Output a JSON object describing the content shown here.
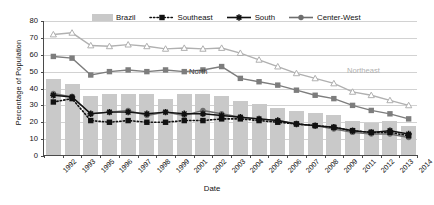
{
  "chart_data": {
    "type": "bar",
    "title": "",
    "xlabel": "Date",
    "ylabel": "Percentage of Population",
    "ylim": [
      0,
      80
    ],
    "ytick_step": 10,
    "yticks": [
      0,
      10,
      20,
      30,
      40,
      50,
      60,
      70,
      80
    ],
    "grid": true,
    "legend_position": "top",
    "categories": [
      "1992",
      "1993",
      "1995",
      "1996",
      "1997",
      "1998",
      "1999",
      "2001",
      "2002",
      "2003",
      "2004",
      "2005",
      "2006",
      "2007",
      "2008",
      "2009",
      "2011",
      "2012",
      "2013",
      "2014"
    ],
    "series": [
      {
        "name": "Brazil",
        "kind": "bar",
        "color": "#c9c9c9",
        "values": [
          45,
          42,
          35,
          36,
          36,
          36,
          33,
          36,
          36,
          35,
          32,
          30,
          28,
          26,
          25,
          24,
          20,
          19,
          20,
          17
        ]
      },
      {
        "name": "Northeast",
        "kind": "line",
        "marker": "open-triangle",
        "color": "#b0b0b0",
        "inline_label": "Northeast",
        "values": [
          72,
          73,
          65.5,
          65,
          66,
          65,
          63.5,
          64,
          63.5,
          64,
          61,
          57,
          53,
          49,
          46,
          43,
          38,
          36,
          33,
          30
        ]
      },
      {
        "name": "North",
        "kind": "line",
        "marker": "filled-square",
        "color": "#7d7d7d",
        "inline_label": "North",
        "values": [
          59,
          58,
          48,
          50,
          51,
          50,
          51,
          50,
          51,
          53,
          46,
          44,
          42,
          39,
          36,
          34,
          30,
          27,
          25,
          22
        ]
      },
      {
        "name": "Center-West",
        "kind": "line",
        "marker": "filled-circle",
        "color": "#6e6e6e",
        "values": [
          37,
          35,
          25,
          26,
          27,
          24,
          26,
          24,
          27,
          25,
          23,
          22,
          21,
          19,
          18,
          16,
          14,
          13,
          13,
          11
        ]
      },
      {
        "name": "South",
        "kind": "line",
        "marker": "star-burst",
        "color": "#111111",
        "values": [
          36,
          35,
          25,
          26,
          26,
          25,
          26,
          25,
          25,
          24,
          23,
          22,
          21,
          19,
          18,
          17,
          15,
          14,
          15,
          13
        ]
      },
      {
        "name": "Southeast",
        "kind": "line-dotted",
        "marker": "filled-square",
        "color": "#111111",
        "values": [
          32,
          34,
          21,
          20,
          21,
          20,
          20,
          21,
          21,
          22,
          22,
          21,
          20,
          19,
          18,
          17,
          15,
          14,
          14,
          12
        ]
      }
    ]
  },
  "axes": {
    "ylabel": "Percentage of Population",
    "xlabel": "Date",
    "ytick_labels": [
      "80",
      "70",
      "60",
      "50",
      "40",
      "30",
      "20",
      "10",
      "0"
    ],
    "xtick_labels": [
      "1992",
      "1993",
      "1995",
      "1996",
      "1997",
      "1998",
      "1999",
      "2001",
      "2002",
      "2003",
      "2004",
      "2005",
      "2006",
      "2007",
      "2008",
      "2009",
      "2011",
      "2012",
      "2013",
      "2014"
    ]
  },
  "legend": {
    "entries": [
      {
        "label": "Brazil",
        "icon": "filled-bar-swatch-icon"
      },
      {
        "label": "Southeast",
        "icon": "dotted-line-square-marker-icon"
      },
      {
        "label": "South",
        "icon": "solid-line-star-marker-icon"
      },
      {
        "label": "Center-West",
        "icon": "solid-line-circle-marker-icon"
      }
    ]
  },
  "annotations": {
    "north": "North",
    "northeast": "Northeast"
  }
}
